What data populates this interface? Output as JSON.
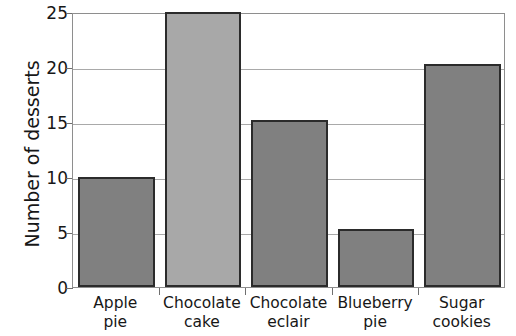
{
  "chart_data": {
    "type": "bar",
    "title": "",
    "xlabel": "",
    "ylabel": "Number of desserts",
    "categories": [
      "Apple pie",
      "Chocolate cake",
      "Chocolate eclair",
      "Blueberry pie",
      "Sugar cookies"
    ],
    "category_lines": [
      [
        "Apple",
        "pie"
      ],
      [
        "Chocolate",
        "cake"
      ],
      [
        "Chocolate",
        "eclair"
      ],
      [
        "Blueberry",
        "pie"
      ],
      [
        "Sugar",
        "cookies"
      ]
    ],
    "values": [
      10,
      25,
      15.2,
      5.3,
      20.3
    ],
    "ylim": [
      0,
      25
    ],
    "yticks": [
      0,
      5,
      10,
      15,
      20,
      25
    ],
    "ytick_labels": [
      "0",
      "5",
      "10",
      "15",
      "20",
      "25"
    ],
    "grid": true,
    "grid_axis": "y",
    "legend": "none",
    "bar_fills": [
      "#808080",
      "#a8a8a8",
      "#808080",
      "#808080",
      "#808080"
    ],
    "bar_edge_color": "#2b2b2b",
    "gridline_color": "#a9a9a9",
    "frame_color": "#8e8e8e",
    "background_color": "#ffffff"
  }
}
